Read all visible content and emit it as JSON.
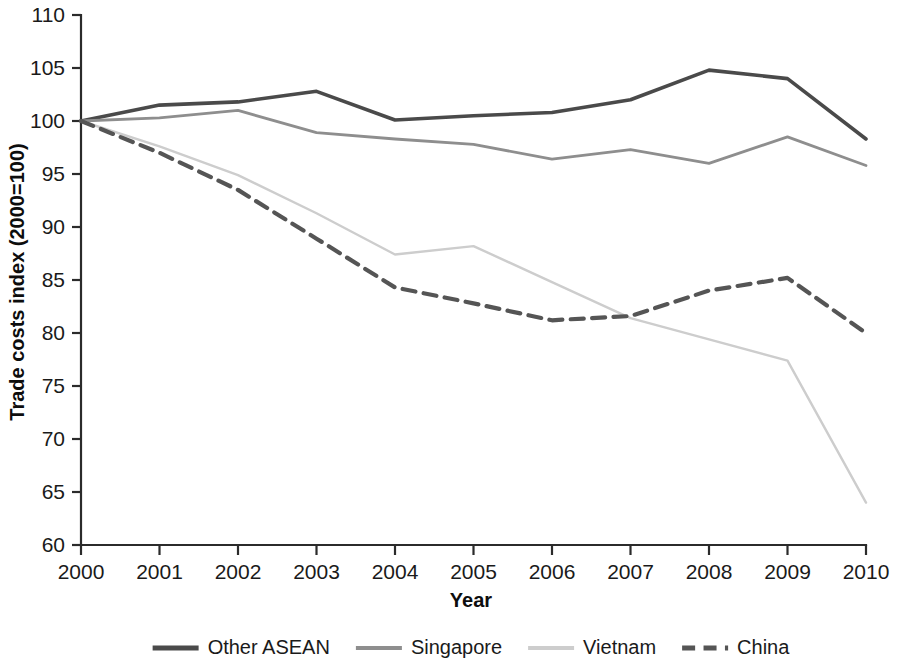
{
  "chart_data": {
    "type": "line",
    "title": "",
    "xlabel": "Year",
    "ylabel": "Trade costs index (2000=100)",
    "x": [
      2000,
      2001,
      2002,
      2003,
      2004,
      2005,
      2006,
      2007,
      2008,
      2009,
      2010
    ],
    "categories": [
      "2000",
      "2001",
      "2002",
      "2003",
      "2004",
      "2005",
      "2006",
      "2007",
      "2008",
      "2009",
      "2010"
    ],
    "xlim": [
      2000,
      2010
    ],
    "ylim": [
      60,
      110
    ],
    "yticks": [
      60,
      65,
      70,
      75,
      80,
      85,
      90,
      95,
      100,
      105,
      110
    ],
    "ytick_labels": [
      "60",
      "65",
      "70",
      "75",
      "80",
      "85",
      "90",
      "95",
      "100",
      "105",
      "110"
    ],
    "grid": false,
    "legend_position": "bottom",
    "series": [
      {
        "name": "Other ASEAN",
        "color": "#4a4a4a",
        "linestyle": "solid",
        "linewidth": 3.6,
        "values": [
          100.0,
          101.5,
          101.8,
          102.8,
          100.1,
          100.5,
          100.8,
          102.0,
          104.8,
          104.0,
          98.3
        ]
      },
      {
        "name": "Singapore",
        "color": "#8e8e8e",
        "linestyle": "solid",
        "linewidth": 2.8,
        "values": [
          100.0,
          100.3,
          101.0,
          98.9,
          98.3,
          97.8,
          96.4,
          97.3,
          96.0,
          98.5,
          95.8
        ]
      },
      {
        "name": "Vietnam",
        "color": "#cdcdcd",
        "linestyle": "solid",
        "linewidth": 2.4,
        "values": [
          100.0,
          97.6,
          94.9,
          91.3,
          87.4,
          88.2,
          84.8,
          81.4,
          79.4,
          77.4,
          64.0
        ]
      },
      {
        "name": "China",
        "color": "#555555",
        "linestyle": "dashed",
        "linewidth": 4.2,
        "values": [
          100.0,
          97.0,
          93.5,
          88.9,
          84.3,
          82.8,
          81.2,
          81.6,
          84.0,
          85.2,
          80.0
        ]
      }
    ]
  },
  "legend": {
    "items": [
      {
        "label": "Other ASEAN"
      },
      {
        "label": "Singapore"
      },
      {
        "label": "Vietnam"
      },
      {
        "label": "China"
      }
    ]
  }
}
